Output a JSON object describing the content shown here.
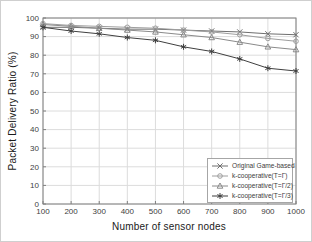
{
  "chart_data": {
    "type": "line",
    "title": "",
    "xlabel": "Number of sensor nodes",
    "ylabel": "Packet Delivery Ratio (%)",
    "x": [
      100,
      200,
      300,
      400,
      500,
      600,
      700,
      800,
      900,
      1000
    ],
    "xlim": [
      100,
      1000
    ],
    "ylim": [
      0,
      100
    ],
    "x_ticks": [
      100,
      200,
      300,
      400,
      500,
      600,
      700,
      800,
      900,
      1000
    ],
    "y_ticks": [
      0,
      10,
      20,
      30,
      40,
      50,
      60,
      70,
      80,
      90,
      100
    ],
    "grid": true,
    "legend_position": "bottom-right",
    "colors": {
      "grid": "#dcdcdc",
      "axis": "#808080",
      "tick_label": "#404040"
    },
    "series": [
      {
        "name": "Original Game-based",
        "marker": "x",
        "color": "#6e6e6e",
        "values": [
          95,
          95,
          94.5,
          94,
          94,
          93.5,
          93,
          92.5,
          91.5,
          91
        ]
      },
      {
        "name": "k-cooperative(T=Γ)",
        "marker": "circle",
        "color": "#9e9e9e",
        "values": [
          97,
          96,
          95.5,
          95,
          94.5,
          93.5,
          92.5,
          91,
          89,
          87.5
        ]
      },
      {
        "name": "k-cooperative(T=Γ/2)",
        "marker": "triangle",
        "color": "#8a8a8a",
        "values": [
          96.5,
          95.5,
          94.5,
          93.5,
          92.5,
          91,
          89.5,
          87,
          84.5,
          83
        ]
      },
      {
        "name": "k-cooperative(T=Γ/3)",
        "marker": "asterisk",
        "color": "#3f3f3f",
        "values": [
          95,
          93,
          91.5,
          89.5,
          88,
          84.5,
          82,
          78,
          73,
          71.5
        ]
      }
    ]
  }
}
